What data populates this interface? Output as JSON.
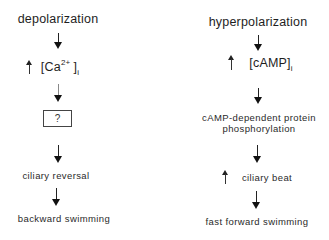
{
  "left": {
    "title": "depolarization",
    "calcium": {
      "prefix": "[Ca",
      "superscript": "2+",
      "suffix": "]",
      "subscript": "i",
      "change": "increase"
    },
    "unknown_box": "?",
    "step3": "ciliary reversal",
    "result": "backward swimming"
  },
  "right": {
    "title": "hyperpolarization",
    "camp": {
      "prefix": "[cAMP]",
      "subscript": "i",
      "change": "increase"
    },
    "step2_line1": "cAMP-dependent protein",
    "step2_line2": "phosphorylation",
    "step3": "ciliary beat",
    "step3_change": "increase",
    "result": "fast forward swimming"
  },
  "colors": {
    "text": "#222222",
    "background": "#ffffff",
    "arrow": "#111111"
  }
}
